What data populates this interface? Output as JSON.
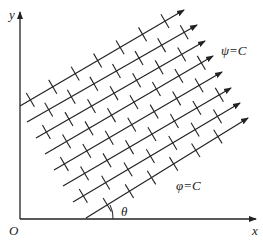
{
  "labels": {
    "y_axis": "y",
    "x_axis": "x",
    "origin": "O",
    "psi": "ψ=C",
    "phi": "φ=C",
    "theta": "θ"
  },
  "colors": {
    "ink": "#222222",
    "background": "#ffffff"
  },
  "streamlines": [
    {
      "x1": 20,
      "y1": 106,
      "x2": 184,
      "y2": 10
    },
    {
      "x1": 27,
      "y1": 122,
      "x2": 197,
      "y2": 25
    },
    {
      "x1": 36,
      "y1": 138,
      "x2": 205,
      "y2": 41
    },
    {
      "x1": 45,
      "y1": 154,
      "x2": 213,
      "y2": 56
    },
    {
      "x1": 54,
      "y1": 170,
      "x2": 222,
      "y2": 72
    },
    {
      "x1": 63,
      "y1": 186,
      "x2": 231,
      "y2": 88
    },
    {
      "x1": 73,
      "y1": 202,
      "x2": 240,
      "y2": 103
    },
    {
      "x1": 86,
      "y1": 218,
      "x2": 248,
      "y2": 118
    }
  ],
  "equipotential_tick_offsets": [
    12,
    38,
    64,
    90,
    116,
    142,
    168
  ]
}
